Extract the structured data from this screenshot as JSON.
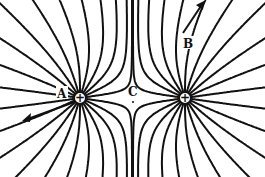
{
  "diagram": {
    "type": "electric-field-lines",
    "charges": [
      {
        "id": "left",
        "sign": "+",
        "x": 80,
        "y": 98
      },
      {
        "id": "right",
        "sign": "+",
        "x": 185,
        "y": 98
      }
    ],
    "points": [
      {
        "label": "A",
        "x": 63,
        "y": 94
      },
      {
        "label": "B",
        "x": 188,
        "y": 44
      },
      {
        "label": "C",
        "x": 133,
        "y": 95
      }
    ],
    "colors": {
      "line": "#111111",
      "background": "#ffffff"
    }
  }
}
